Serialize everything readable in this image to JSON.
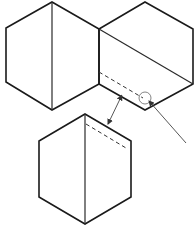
{
  "diagram": {
    "colors": {
      "line": "#1a1a1a",
      "dash": "#333333",
      "background": "#ffffff"
    },
    "shapes": [
      {
        "id": "hexagon-top-left",
        "fold_line": "vertical center"
      },
      {
        "id": "hexagon-top-right",
        "fold_line": "diagonal",
        "dashed_line": true,
        "circled_detail": true
      },
      {
        "id": "hexagon-bottom",
        "fold_line": "vertical center",
        "dashed_line": true
      }
    ],
    "connectors": [
      {
        "id": "double-arrow",
        "from": "hexagon-top-right bottom-left edge",
        "to": "hexagon-bottom top-right edge"
      },
      {
        "id": "pointer-line",
        "target": "circled detail on hexagon-top-right"
      }
    ]
  }
}
